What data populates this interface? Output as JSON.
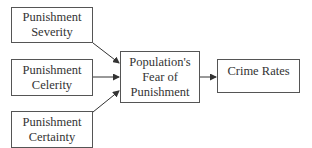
{
  "diagram": {
    "type": "flowchart",
    "nodes": [
      {
        "id": "severity",
        "lines": [
          "Punishment",
          "Severity"
        ]
      },
      {
        "id": "celerity",
        "lines": [
          "Punishment",
          "Celerity"
        ]
      },
      {
        "id": "certainty",
        "lines": [
          "Punishment",
          "Certainty"
        ]
      },
      {
        "id": "fear",
        "lines": [
          "Population's",
          "Fear of",
          "Punishment"
        ]
      },
      {
        "id": "crime",
        "lines": [
          "Crime Rates"
        ]
      }
    ],
    "edges": [
      {
        "from": "severity",
        "to": "fear"
      },
      {
        "from": "celerity",
        "to": "fear"
      },
      {
        "from": "certainty",
        "to": "fear"
      },
      {
        "from": "fear",
        "to": "crime"
      }
    ]
  }
}
